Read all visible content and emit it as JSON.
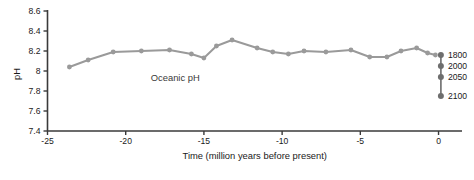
{
  "chart_data": {
    "type": "line",
    "title": "",
    "xlabel": "Time (million years before present)",
    "ylabel": "pH",
    "xlim": [
      -25,
      1.5
    ],
    "ylim": [
      7.4,
      8.6
    ],
    "grid": false,
    "legend_position": "none",
    "xticks": [
      -25,
      -20,
      -15,
      -10,
      -5,
      0
    ],
    "xticklabels": [
      "-25",
      "-20",
      "-15",
      "-10",
      "-5",
      "0"
    ],
    "yticks": [
      7.4,
      7.6,
      7.8,
      8,
      8.2,
      8.4,
      8.6
    ],
    "yticklabels": [
      "7.4",
      "7.6",
      "7.8",
      "8",
      "8.2",
      "8.4",
      "8.6"
    ],
    "annotations": [
      {
        "text": "Oceanic pH",
        "x": -18.4,
        "y": 7.9
      }
    ],
    "series": [
      {
        "name": "Oceanic pH",
        "color": "#9a9a9a",
        "x": [
          -23.6,
          -22.4,
          -20.8,
          -19.0,
          -17.2,
          -15.8,
          -15.0,
          -14.2,
          -13.2,
          -11.6,
          -10.6,
          -9.6,
          -8.6,
          -7.2,
          -5.6,
          -4.4,
          -3.3,
          -2.4,
          -1.4,
          -0.7,
          -0.2
        ],
        "y": [
          8.04,
          8.11,
          8.19,
          8.2,
          8.21,
          8.17,
          8.13,
          8.25,
          8.31,
          8.23,
          8.19,
          8.17,
          8.2,
          8.19,
          8.21,
          8.14,
          8.14,
          8.2,
          8.23,
          8.18,
          8.16
        ]
      }
    ],
    "projection": {
      "name": "Future pH projections",
      "x": 0.15,
      "color": "#6e6e6e",
      "points": [
        {
          "label": "1800",
          "ph": 8.16
        },
        {
          "label": "2000",
          "ph": 8.05
        },
        {
          "label": "2050",
          "ph": 7.94
        },
        {
          "label": "2100",
          "ph": 7.75
        }
      ]
    }
  }
}
